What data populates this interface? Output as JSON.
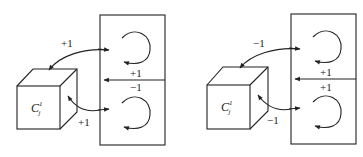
{
  "diagram": {
    "panels": [
      {
        "id": "left",
        "cube": {
          "label": "C",
          "subscript": "j",
          "superscript": "1"
        },
        "labels": {
          "top_arrow": "+1",
          "bottom_arrow": "+1",
          "divider_upper": "+1",
          "divider_lower": "−1"
        }
      },
      {
        "id": "right",
        "cube": {
          "label": "C",
          "subscript": "j",
          "superscript": "1"
        },
        "labels": {
          "top_arrow": "−1",
          "bottom_arrow": "−1",
          "divider_upper": "+1",
          "divider_lower": "+1"
        }
      }
    ]
  }
}
